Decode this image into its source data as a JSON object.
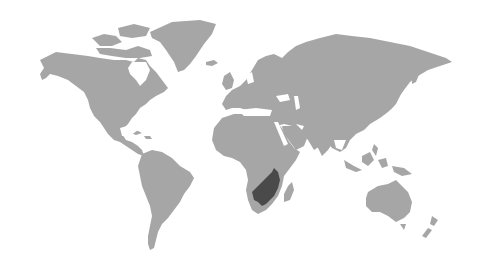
{
  "map": {
    "type": "world-choropleth",
    "background_color": "#ffffff",
    "land_color": "#a6a6a6",
    "highlight_color": "#4a4a4a",
    "highlighted_region": "southern-africa",
    "labels": []
  }
}
